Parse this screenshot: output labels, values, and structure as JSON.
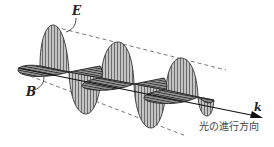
{
  "figure": {
    "labels": {
      "electric_field": "E",
      "magnetic_field": "B",
      "wave_vector": "k"
    },
    "caption": "光の進行方向"
  },
  "colors": {
    "line": "#333333",
    "e_fill": "#b8b8b8",
    "b_fill": "#6e6e6e",
    "dash": "#555555"
  }
}
